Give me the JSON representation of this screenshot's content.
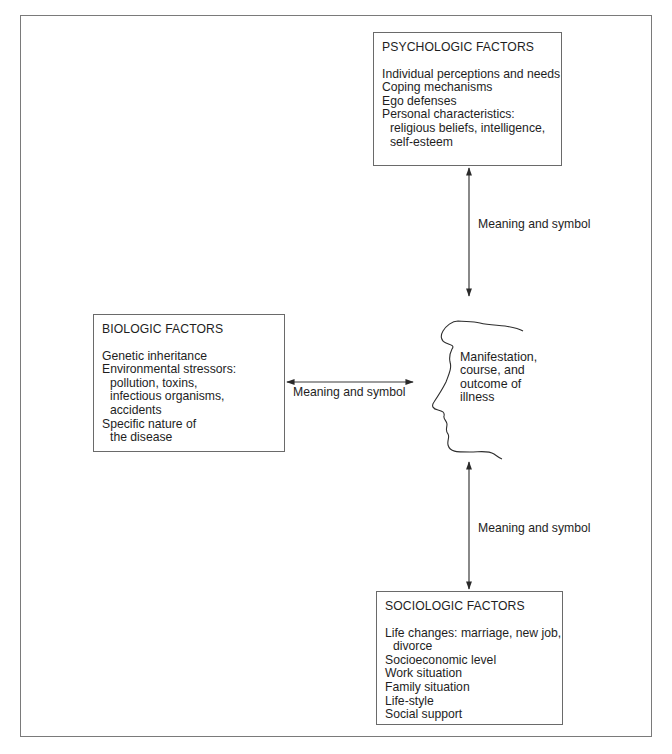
{
  "diagram": {
    "colors": {
      "line": "#3a3a3a",
      "frame": "#7a7a7a",
      "text": "#1e1e1e",
      "background": "#ffffff"
    },
    "psychologic": {
      "title": "PSYCHOLOGIC FACTORS",
      "items": [
        {
          "text": "Individual perceptions and needs",
          "indent": false
        },
        {
          "text": "Coping mechanisms",
          "indent": false
        },
        {
          "text": "Ego defenses",
          "indent": false
        },
        {
          "text": "Personal characteristics:",
          "indent": false
        },
        {
          "text": "religious beliefs, intelligence,",
          "indent": true
        },
        {
          "text": "self-esteem",
          "indent": true
        }
      ]
    },
    "biologic": {
      "title": "BIOLOGIC FACTORS",
      "items": [
        {
          "text": "Genetic inheritance",
          "indent": false
        },
        {
          "text": "Environmental stressors:",
          "indent": false
        },
        {
          "text": "pollution, toxins,",
          "indent": true
        },
        {
          "text": "infectious organisms,",
          "indent": true
        },
        {
          "text": "accidents",
          "indent": true
        },
        {
          "text": "Specific nature of",
          "indent": false
        },
        {
          "text": "the disease",
          "indent": true
        }
      ]
    },
    "sociologic": {
      "title": "SOCIOLOGIC FACTORS",
      "items": [
        {
          "text": "Life changes: marriage, new job,",
          "indent": false
        },
        {
          "text": "divorce",
          "indent": true
        },
        {
          "text": "Socioeconomic level",
          "indent": false
        },
        {
          "text": "Work situation",
          "indent": false
        },
        {
          "text": "Family situation",
          "indent": false
        },
        {
          "text": "Life-style",
          "indent": false
        },
        {
          "text": "Social support",
          "indent": false
        }
      ]
    },
    "center": {
      "icon": "head-profile-icon",
      "lines": [
        "Manifestation,",
        "course, and",
        "outcome of",
        "illness"
      ]
    },
    "connectors": {
      "top_label": "Meaning and symbol",
      "middle_label": "Meaning and symbol",
      "bottom_label": "Meaning and symbol"
    }
  }
}
